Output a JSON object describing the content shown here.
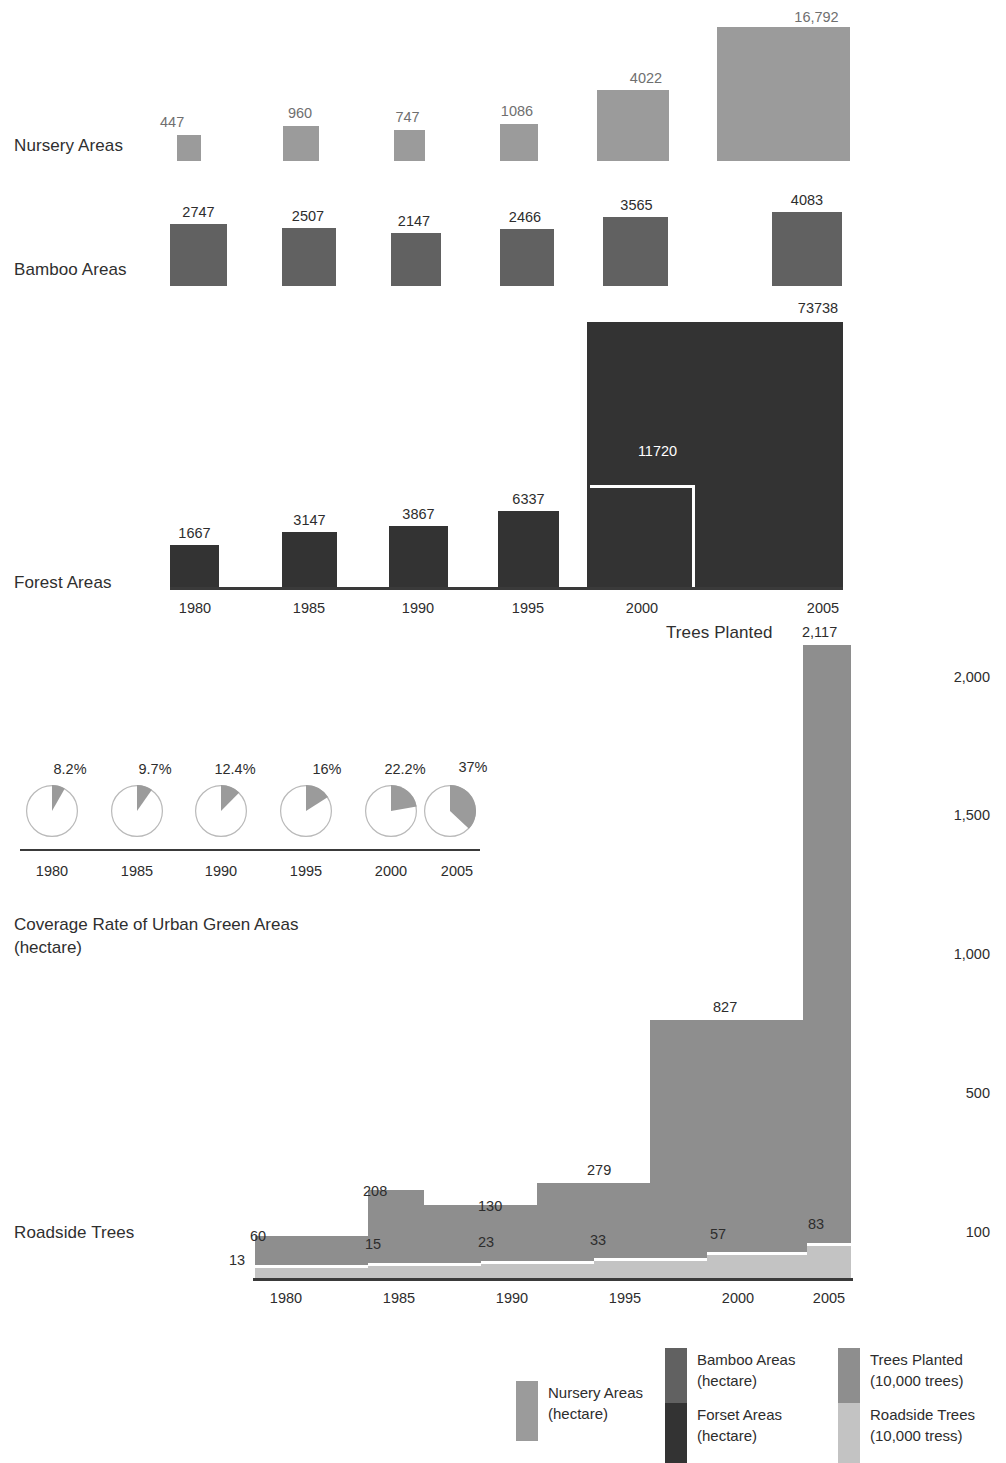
{
  "colors": {
    "nursery": "#9b9b9b",
    "bamboo": "#616161",
    "forest": "#333333",
    "trees_planted": "#8e8e8e",
    "roadside": "#c3c3c3",
    "axis": "#3a3a3a",
    "label_light": "#6f6f6f",
    "label_dark": "#2d2d2d",
    "pie_slice": "#9b9b9b",
    "pie_stroke": "#b9b9b9",
    "background": "#ffffff"
  },
  "years": [
    "1980",
    "1985",
    "1990",
    "1995",
    "2000",
    "2005"
  ],
  "rows": {
    "nursery_label": "Nursery Areas",
    "bamboo_label": "Bamboo Areas",
    "forest_label": "Forest Areas",
    "roadside_label": "Roadside Trees",
    "trees_planted_label": "Trees Planted"
  },
  "caption": "Coverage Rate of Urban Green Areas\n(hectare)",
  "legend": [
    {
      "name": "nursery",
      "label": "Nursery Areas\n(hectare)",
      "color": "#9b9b9b"
    },
    {
      "name": "bamboo",
      "label": "Bamboo Areas\n(hectare)",
      "color": "#616161"
    },
    {
      "name": "forest",
      "label": "Forset Areas\n(hectare)",
      "color": "#333333"
    },
    {
      "name": "trees-planted",
      "label": "Trees Planted\n(10,000 trees)",
      "color": "#8e8e8e"
    },
    {
      "name": "roadside",
      "label": "Roadside Trees\n(10,000 tress)",
      "color": "#c3c3c3"
    }
  ],
  "chart_data": [
    {
      "type": "bar",
      "title": "Nursery Areas",
      "ylabel": "hectare",
      "categories": [
        "1980",
        "1985",
        "1990",
        "1995",
        "2000",
        "2005"
      ],
      "values": [
        447,
        960,
        747,
        1086,
        4022,
        16792
      ],
      "labels": [
        "447",
        "960",
        "747",
        "1086",
        "4022",
        "16,792"
      ],
      "grid": false,
      "legend": "bottom"
    },
    {
      "type": "bar",
      "title": "Bamboo Areas",
      "ylabel": "hectare",
      "categories": [
        "1980",
        "1985",
        "1990",
        "1995",
        "2000",
        "2005"
      ],
      "values": [
        2747,
        2507,
        2147,
        2466,
        3565,
        4083
      ],
      "labels": [
        "2747",
        "2507",
        "2147",
        "2466",
        "3565",
        "4083"
      ],
      "grid": false,
      "legend": "bottom"
    },
    {
      "type": "bar",
      "title": "Forest Areas",
      "ylabel": "hectare",
      "categories": [
        "1980",
        "1985",
        "1990",
        "1995",
        "2000",
        "2005"
      ],
      "values": [
        1667,
        3147,
        3867,
        6337,
        11720,
        73738
      ],
      "labels": [
        "1667",
        "3147",
        "3867",
        "6337",
        "11720",
        "73738"
      ],
      "grid": false,
      "legend": "bottom"
    },
    {
      "type": "pie",
      "title": "Coverage Rate of Urban Green Areas",
      "categories": [
        "1980",
        "1985",
        "1990",
        "1995",
        "2000",
        "2005"
      ],
      "values": [
        8.2,
        9.7,
        12.4,
        16,
        22.2,
        37
      ],
      "labels": [
        "8.2%",
        "9.7%",
        "12.4%",
        "16%",
        "22.2%",
        "37%"
      ],
      "grid": false
    },
    {
      "type": "area",
      "title": "Trees Planted / Roadside Trees",
      "categories": [
        "1980",
        "1985",
        "1990",
        "1995",
        "2000",
        "2005"
      ],
      "ylim": [
        0,
        2200
      ],
      "yticks": [
        100,
        500,
        1000,
        1500,
        2000
      ],
      "ytick_labels": [
        "100",
        "500",
        "1,000",
        "1,500",
        "2,000"
      ],
      "grid": false,
      "series": [
        {
          "name": "Trees Planted (10,000 trees)",
          "values": [
            60,
            208,
            130,
            279,
            827,
            2117
          ],
          "labels": [
            "60",
            "208",
            "130",
            "279",
            "827",
            "2,117"
          ]
        },
        {
          "name": "Roadside Trees (10,000 tress)",
          "values": [
            13,
            15,
            23,
            33,
            57,
            83
          ],
          "labels": [
            "13",
            "15",
            "23",
            "33",
            "57",
            "83"
          ]
        }
      ]
    }
  ],
  "nursery_bars": [
    {
      "year": "1980",
      "label": "447",
      "x": 177,
      "y": 135,
      "w": 24,
      "h": 26,
      "lx": 160,
      "ly": 114
    },
    {
      "year": "1985",
      "label": "960",
      "x": 283,
      "y": 126,
      "w": 36,
      "h": 35,
      "lx": 282,
      "ly": 105
    },
    {
      "year": "1990",
      "label": "747",
      "x": 394,
      "y": 130,
      "w": 31,
      "h": 31,
      "lx": 392,
      "ly": 109
    },
    {
      "year": "1995",
      "label": "1086",
      "x": 500,
      "y": 124,
      "w": 38,
      "h": 37,
      "lx": 498,
      "ly": 103
    },
    {
      "year": "2000",
      "label": "4022",
      "x": 597,
      "y": 90,
      "w": 72,
      "h": 71,
      "lx": 610,
      "ly": 70
    },
    {
      "year": "2005",
      "label": "16,792",
      "x": 717,
      "y": 27,
      "w": 133,
      "h": 134,
      "lx": 750,
      "ly": 9
    }
  ],
  "bamboo_bars": [
    {
      "year": "1980",
      "label": "2747",
      "x": 170,
      "y": 224,
      "w": 57,
      "h": 62,
      "lx": 170,
      "ly": 204
    },
    {
      "year": "1985",
      "label": "2507",
      "x": 282,
      "y": 228,
      "w": 54,
      "h": 58,
      "lx": 281,
      "ly": 208
    },
    {
      "year": "1990",
      "label": "2147",
      "x": 391,
      "y": 233,
      "w": 50,
      "h": 53,
      "lx": 389,
      "ly": 213
    },
    {
      "year": "1995",
      "label": "2466",
      "x": 500,
      "y": 229,
      "w": 54,
      "h": 57,
      "lx": 498,
      "ly": 209
    },
    {
      "year": "2000",
      "label": "3565",
      "x": 603,
      "y": 217,
      "w": 65,
      "h": 69,
      "lx": 604,
      "ly": 197
    },
    {
      "year": "2005",
      "label": "4083",
      "x": 772,
      "y": 212,
      "w": 70,
      "h": 74,
      "lx": 772,
      "ly": 192
    }
  ],
  "forest_bars": [
    {
      "year": "1980",
      "label": "1667",
      "x": 170,
      "y": 545,
      "w": 49,
      "h": 42,
      "lx": 170,
      "ly": 525,
      "white": false
    },
    {
      "year": "1985",
      "label": "3147",
      "x": 282,
      "y": 532,
      "w": 55,
      "h": 55,
      "lx": 282,
      "ly": 512,
      "white": false
    },
    {
      "year": "1990",
      "label": "3867",
      "x": 389,
      "y": 526,
      "w": 59,
      "h": 61,
      "lx": 389,
      "ly": 506,
      "white": false
    },
    {
      "year": "1995",
      "label": "6337",
      "x": 498,
      "y": 511,
      "w": 61,
      "h": 76,
      "lx": 498,
      "ly": 491,
      "white": false
    },
    {
      "year": "2000",
      "label": "11720",
      "x": 590,
      "y": 485,
      "w": 105,
      "h": 102,
      "lx": 605,
      "ly": 443,
      "white": true
    },
    {
      "year": "2005",
      "label": "73738",
      "x": 587,
      "y": 322,
      "w": 256,
      "h": 265,
      "lx": 690,
      "ly": 300,
      "white": false
    }
  ],
  "pies": [
    {
      "year": "1980",
      "label": "8.2%",
      "cx": 52,
      "cy": 811,
      "r": 26,
      "pct": 8.2,
      "lx": 35,
      "ly": 761
    },
    {
      "year": "1985",
      "label": "9.7%",
      "cx": 137,
      "cy": 811,
      "r": 26,
      "pct": 9.7,
      "lx": 120,
      "ly": 761
    },
    {
      "year": "1990",
      "label": "12.4%",
      "cx": 221,
      "cy": 811,
      "r": 26,
      "pct": 12.4,
      "lx": 200,
      "ly": 761
    },
    {
      "year": "1995",
      "label": "16%",
      "cx": 306,
      "cy": 811,
      "r": 26,
      "pct": 16,
      "lx": 292,
      "ly": 761
    },
    {
      "year": "2000",
      "label": "22.2%",
      "cx": 391,
      "cy": 811,
      "r": 26,
      "pct": 22.2,
      "lx": 370,
      "ly": 761
    },
    {
      "year": "2005",
      "label": "37%",
      "cx": 450,
      "cy": 811,
      "r": 26,
      "pct": 37,
      "lx": 438,
      "ly": 759
    }
  ],
  "pie_ticks": [
    {
      "label": "1980",
      "x": 52
    },
    {
      "label": "1985",
      "x": 137
    },
    {
      "label": "1990",
      "x": 221
    },
    {
      "label": "1995",
      "x": 306
    },
    {
      "label": "2000",
      "x": 391
    },
    {
      "label": "2005",
      "x": 457
    }
  ],
  "forest_ticks": [
    {
      "label": "1980",
      "x": 195
    },
    {
      "label": "1985",
      "x": 309
    },
    {
      "label": "1990",
      "x": 418
    },
    {
      "label": "1995",
      "x": 528
    },
    {
      "label": "2000",
      "x": 642
    },
    {
      "label": "2005",
      "x": 823
    }
  ],
  "trees_ticks": [
    {
      "label": "1980",
      "x": 286
    },
    {
      "label": "1985",
      "x": 399
    },
    {
      "label": "1990",
      "x": 512
    },
    {
      "label": "1995",
      "x": 625
    },
    {
      "label": "2000",
      "x": 738
    },
    {
      "label": "2005",
      "x": 829
    }
  ],
  "right_axis": [
    {
      "label": "2,000",
      "y": 678
    },
    {
      "label": "1,500",
      "y": 816
    },
    {
      "label": "1,000",
      "y": 955
    },
    {
      "label": "500",
      "y": 1094
    },
    {
      "label": "100",
      "y": 1233
    }
  ],
  "tp_steps": [
    {
      "year": "1980",
      "x": 255,
      "w": 113,
      "top": 1236,
      "label": "60",
      "lx": 250,
      "ly": 1228
    },
    {
      "year": "1985",
      "x": 368,
      "w": 56,
      "top": 1190,
      "label": "208",
      "lx": 363,
      "ly": 1183
    },
    {
      "year": "1990",
      "x": 424,
      "w": 113,
      "top": 1205,
      "label": "130",
      "lx": 478,
      "ly": 1198
    },
    {
      "year": "1995",
      "x": 537,
      "w": 113,
      "top": 1183,
      "label": "279",
      "lx": 587,
      "ly": 1162
    },
    {
      "year": "2000",
      "x": 650,
      "w": 153,
      "top": 1020,
      "label": "827",
      "lx": 713,
      "ly": 999
    },
    {
      "year": "2005",
      "x": 803,
      "w": 48,
      "top": 645,
      "label": "2,117",
      "lx": 802,
      "ly": 624
    }
  ],
  "rt_steps": [
    {
      "year": "1980",
      "x": 255,
      "w": 113,
      "top": 1265,
      "label": "13",
      "lx": 229,
      "ly": 1252
    },
    {
      "year": "1985",
      "x": 368,
      "w": 113,
      "top": 1263,
      "label": "15",
      "lx": 365,
      "ly": 1236
    },
    {
      "year": "1990",
      "x": 481,
      "w": 113,
      "top": 1261,
      "label": "23",
      "lx": 478,
      "ly": 1234
    },
    {
      "year": "1995",
      "x": 594,
      "w": 113,
      "top": 1258,
      "label": "33",
      "lx": 590,
      "ly": 1232
    },
    {
      "year": "2000",
      "x": 707,
      "w": 100,
      "top": 1252,
      "label": "57",
      "lx": 710,
      "ly": 1226
    },
    {
      "year": "2005",
      "x": 807,
      "w": 44,
      "top": 1243,
      "label": "83",
      "lx": 808,
      "ly": 1216
    }
  ],
  "legend_positions": [
    {
      "name": "nursery",
      "x": 516,
      "y": 1381
    },
    {
      "name": "bamboo",
      "x": 665,
      "y": 1348
    },
    {
      "name": "forest",
      "x": 665,
      "y": 1403
    },
    {
      "name": "trees-planted",
      "x": 838,
      "y": 1348
    },
    {
      "name": "roadside",
      "x": 838,
      "y": 1403
    }
  ]
}
